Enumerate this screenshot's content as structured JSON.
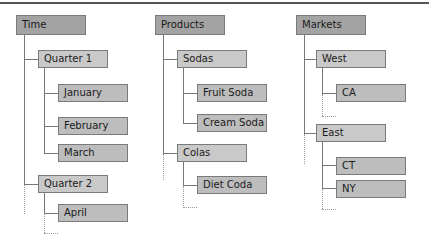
{
  "trees": [
    {
      "root": "Time",
      "children": [
        {
          "label": "Quarter 1",
          "children": [
            "January",
            "February",
            "March"
          ]
        },
        {
          "label": "Quarter 2",
          "children": [
            "April"
          ]
        }
      ]
    },
    {
      "root": "Products",
      "children": [
        {
          "label": "Sodas",
          "children": [
            "Fruit Soda",
            "Cream Soda"
          ]
        },
        {
          "label": "Colas",
          "children": [
            "Diet Coda"
          ]
        }
      ]
    },
    {
      "root": "Markets",
      "children": [
        {
          "label": "West",
          "children": [
            "CA"
          ]
        },
        {
          "label": "East",
          "children": [
            "CT",
            "NY"
          ]
        }
      ]
    }
  ],
  "colors": {
    "root_fill": "#a3a3a3",
    "level1_fill": "#c9c9c9",
    "level2_fill": "#bdbdbd",
    "border": "#7a7a7a"
  }
}
